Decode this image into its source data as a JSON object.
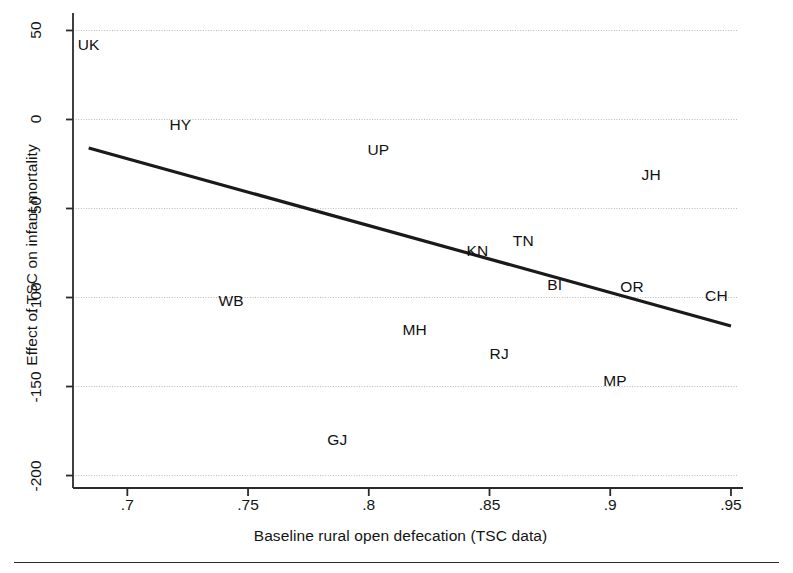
{
  "chart_data": {
    "type": "scatter",
    "title": "",
    "xlabel": "Baseline rural open defecation (TSC data)",
    "ylabel": "Effect of TSC on infant mortality",
    "xlim": [
      0.6775,
      0.9525
    ],
    "ylim": [
      -207,
      57
    ],
    "xticks": [
      0.7,
      0.75,
      0.8,
      0.85,
      0.9,
      0.95
    ],
    "xticklabels": [
      ".7",
      ".75",
      ".8",
      ".85",
      ".9",
      ".95"
    ],
    "yticks": [
      50,
      0,
      -50,
      -100,
      -150,
      -200
    ],
    "yticklabels": [
      "50",
      "0",
      "-50",
      "-100",
      "-150",
      "-200"
    ],
    "grid": "horizontal-dotted",
    "legend": "none",
    "marker_style": "text-label-only",
    "points": [
      {
        "label": "UK",
        "x": 0.684,
        "y": 42
      },
      {
        "label": "HY",
        "x": 0.722,
        "y": -3
      },
      {
        "label": "UP",
        "x": 0.804,
        "y": -17
      },
      {
        "label": "JH",
        "x": 0.917,
        "y": -31
      },
      {
        "label": "KN",
        "x": 0.845,
        "y": -74
      },
      {
        "label": "TN",
        "x": 0.864,
        "y": -68
      },
      {
        "label": "BI",
        "x": 0.877,
        "y": -93
      },
      {
        "label": "OR",
        "x": 0.909,
        "y": -94
      },
      {
        "label": "CH",
        "x": 0.944,
        "y": -99
      },
      {
        "label": "WB",
        "x": 0.743,
        "y": -102
      },
      {
        "label": "MH",
        "x": 0.819,
        "y": -118
      },
      {
        "label": "RJ",
        "x": 0.854,
        "y": -132
      },
      {
        "label": "MP",
        "x": 0.902,
        "y": -147
      },
      {
        "label": "GJ",
        "x": 0.787,
        "y": -180
      }
    ],
    "fit_line": {
      "name": "fitted regression line",
      "x_start": 0.684,
      "y_start": -16,
      "x_end": 0.95,
      "y_end": -116,
      "color": "#1a1a1a",
      "width_px": 3.2
    },
    "axis_color": "#2b2b2b",
    "grid_color": "#b9b9b9",
    "background": "#ffffff"
  }
}
